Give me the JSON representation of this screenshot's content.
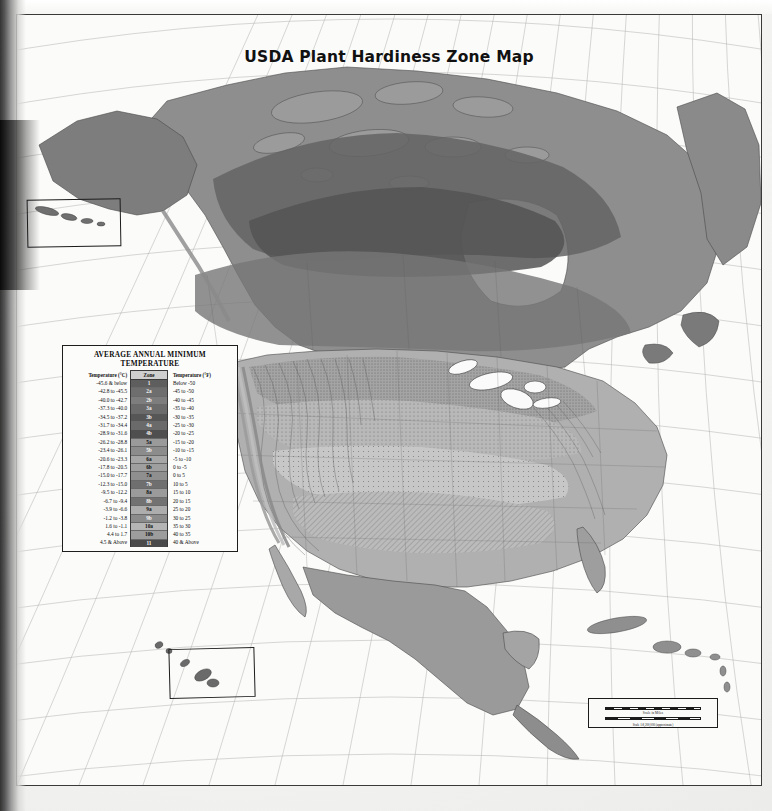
{
  "title": "USDA Plant Hardiness Zone Map",
  "legend": {
    "heading_line1": "AVERAGE  ANNUAL MINIMUM",
    "heading_line2": "TEMPERATURE",
    "columns": [
      "Temperature (°C)",
      "Zone",
      "Temperature (°F)"
    ],
    "rows": [
      {
        "celsius": "-45.6 & below",
        "zone": "1",
        "fahrenheit": "Below  -50",
        "color": "#5e5e5e"
      },
      {
        "celsius": "-42.8 to -45.5",
        "zone": "2a",
        "fahrenheit": "-45 to -50",
        "color": "#6e6e6e"
      },
      {
        "celsius": "-40.0 to -42.7",
        "zone": "2b",
        "fahrenheit": "-40 to -45",
        "color": "#7d7d7d"
      },
      {
        "celsius": "-37.3 to -40.0",
        "zone": "3a",
        "fahrenheit": "-35 to -40",
        "color": "#6b6b6b"
      },
      {
        "celsius": "-34.5 to -37.2",
        "zone": "3b",
        "fahrenheit": "-30 to -35",
        "color": "#565656"
      },
      {
        "celsius": "-31.7 to -34.4",
        "zone": "4a",
        "fahrenheit": "-25 to -30",
        "color": "#6a6a6a"
      },
      {
        "celsius": "-28.9 to -31.6",
        "zone": "4b",
        "fahrenheit": "-20 to -25",
        "color": "#4f4f4f"
      },
      {
        "celsius": "-26.2 to -28.8",
        "zone": "5a",
        "fahrenheit": "-15 to -20",
        "color": "#9a9a9a"
      },
      {
        "celsius": "-23.4 to -26.1",
        "zone": "5b",
        "fahrenheit": "-10 to -15",
        "color": "#8c8c8c"
      },
      {
        "celsius": "-20.6 to -23.3",
        "zone": "6a",
        "fahrenheit": "-5 to -10",
        "color": "#a6a6a6"
      },
      {
        "celsius": "-17.8 to -20.5",
        "zone": "6b",
        "fahrenheit": "0 to -5",
        "color": "#9f9f9f"
      },
      {
        "celsius": "-15.0 to -17.7",
        "zone": "7a",
        "fahrenheit": "0 to 5",
        "color": "#8f8f8f"
      },
      {
        "celsius": "-12.3 to -15.0",
        "zone": "7b",
        "fahrenheit": "10 to 5",
        "color": "#6f6f6f"
      },
      {
        "celsius": "-9.5 to -12.2",
        "zone": "8a",
        "fahrenheit": "15 to 10",
        "color": "#9b9b9b"
      },
      {
        "celsius": "-6.7 to -9.4",
        "zone": "8b",
        "fahrenheit": "20 to 15",
        "color": "#727272"
      },
      {
        "celsius": "-3.9 to -6.6",
        "zone": "9a",
        "fahrenheit": "25 to 20",
        "color": "#adadad"
      },
      {
        "celsius": "-1.2 to -3.8",
        "zone": "9b",
        "fahrenheit": "30 to 25",
        "color": "#8b8b8b"
      },
      {
        "celsius": "1.6 to -1.1",
        "zone": "10a",
        "fahrenheit": "35 to 30",
        "color": "#b5b5b5"
      },
      {
        "celsius": "4.4 to  1.7",
        "zone": "10b",
        "fahrenheit": "40 to 35",
        "color": "#9d9d9d"
      },
      {
        "celsius": "4.5 & Above",
        "zone": "11",
        "fahrenheit": "40 & Above",
        "color": "#4a4a4a"
      }
    ]
  },
  "insets": {
    "aleutian_label": "Aleutian Islands inset",
    "hawaii_label": "Hawaii inset"
  },
  "scale": {
    "miles_label": "Scale in Miles",
    "km_label": "Scale in Kilometers",
    "ratio": "Scale 1:8,200,000 (approximate)",
    "tick_labels": [
      "0",
      "100",
      "200",
      "300",
      "400",
      "500",
      "600"
    ]
  },
  "chart_data": {
    "type": "map",
    "title": "USDA Plant Hardiness Zone Map",
    "region": "North America",
    "variable": "Average Annual Minimum Temperature",
    "classes": [
      {
        "zone": "1",
        "celsius": "-45.6 & below",
        "fahrenheit": "Below -50"
      },
      {
        "zone": "2a",
        "celsius": "-42.8 to -45.5",
        "fahrenheit": "-45 to -50"
      },
      {
        "zone": "2b",
        "celsius": "-40.0 to -42.7",
        "fahrenheit": "-40 to -45"
      },
      {
        "zone": "3a",
        "celsius": "-37.3 to -40.0",
        "fahrenheit": "-35 to -40"
      },
      {
        "zone": "3b",
        "celsius": "-34.5 to -37.2",
        "fahrenheit": "-30 to -35"
      },
      {
        "zone": "4a",
        "celsius": "-31.7 to -34.4",
        "fahrenheit": "-25 to -30"
      },
      {
        "zone": "4b",
        "celsius": "-28.9 to -31.6",
        "fahrenheit": "-20 to -25"
      },
      {
        "zone": "5a",
        "celsius": "-26.2 to -28.8",
        "fahrenheit": "-15 to -20"
      },
      {
        "zone": "5b",
        "celsius": "-23.4 to -26.1",
        "fahrenheit": "-10 to -15"
      },
      {
        "zone": "6a",
        "celsius": "-20.6 to -23.3",
        "fahrenheit": "-5 to -10"
      },
      {
        "zone": "6b",
        "celsius": "-17.8 to -20.5",
        "fahrenheit": "0 to -5"
      },
      {
        "zone": "7a",
        "celsius": "-15.0 to -17.7",
        "fahrenheit": "0 to 5"
      },
      {
        "zone": "7b",
        "celsius": "-12.3 to -15.0",
        "fahrenheit": "10 to 5"
      },
      {
        "zone": "8a",
        "celsius": "-9.5 to -12.2",
        "fahrenheit": "15 to 10"
      },
      {
        "zone": "8b",
        "celsius": "-6.7 to -9.4",
        "fahrenheit": "20 to 15"
      },
      {
        "zone": "9a",
        "celsius": "-3.9 to -6.6",
        "fahrenheit": "25 to 20"
      },
      {
        "zone": "9b",
        "celsius": "-1.2 to -3.8",
        "fahrenheit": "30 to 25"
      },
      {
        "zone": "10a",
        "celsius": "1.6 to -1.1",
        "fahrenheit": "35 to 30"
      },
      {
        "zone": "10b",
        "celsius": "4.4 to 1.7",
        "fahrenheit": "40 to 35"
      },
      {
        "zone": "11",
        "celsius": "4.5 & Above",
        "fahrenheit": "40 & Above"
      }
    ]
  }
}
